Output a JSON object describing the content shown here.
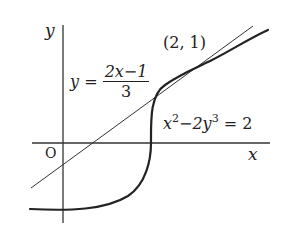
{
  "diagram": {
    "axes": {
      "x_label": "x",
      "y_label": "y",
      "origin_label": "O"
    },
    "curve": {
      "equation_lhs_x": "x",
      "equation_x_exp": "2",
      "equation_mid": "−2y",
      "equation_y_exp": "3",
      "equation_rhs": " = 2",
      "full_equation": "x^2 - 2y^3 = 2"
    },
    "tangent_line": {
      "lhs": "y =",
      "numerator": "2x−1",
      "denominator": "3",
      "full_equation": "y = (2x-1)/3"
    },
    "tangent_point": {
      "label": "(2, 1)",
      "x": 2,
      "y": 1
    },
    "colors": {
      "ink": "#222222",
      "axis": "#333333",
      "background": "#ffffff"
    }
  }
}
